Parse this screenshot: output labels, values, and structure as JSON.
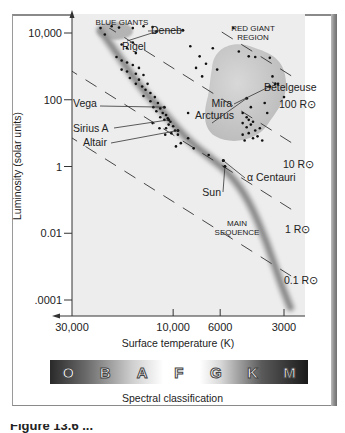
{
  "chart_data": {
    "type": "scatter",
    "xlabel": "Surface temperature (K)",
    "ylabel": "Luminosity (solar units)",
    "x_scale": "log",
    "y_scale": "log",
    "x_reversed": true,
    "xlim": [
      35000,
      2500
    ],
    "ylim": [
      3e-05,
      50000
    ],
    "x_ticks": [
      30000,
      10000,
      6000,
      3000
    ],
    "x_tick_labels": [
      "30,000",
      "10,000",
      "6000",
      "3000"
    ],
    "y_ticks": [
      10000,
      100,
      1,
      0.01,
      0.0001
    ],
    "y_tick_labels": [
      "10,000",
      "100",
      "1",
      "0.01",
      ".0001"
    ],
    "grid": false,
    "regions": [
      {
        "name": "BLUE GIANTS",
        "label_lines": [
          "BLUE GIANTS"
        ]
      },
      {
        "name": "RED GIANT REGION",
        "label_lines": [
          "RED GIANT",
          "REGION"
        ]
      },
      {
        "name": "MAIN SEQUENCE",
        "label_lines": [
          "MAIN",
          "SEQUENCE"
        ]
      }
    ],
    "main_sequence_band": [
      {
        "T": 22000,
        "L": 12000
      },
      {
        "T": 18000,
        "L": 2000
      },
      {
        "T": 14000,
        "L": 200
      },
      {
        "T": 11000,
        "L": 40
      },
      {
        "T": 8500,
        "L": 6
      },
      {
        "T": 6500,
        "L": 1.6
      },
      {
        "T": 5400,
        "L": 0.6
      },
      {
        "T": 4400,
        "L": 0.1
      },
      {
        "T": 3600,
        "L": 0.005
      },
      {
        "T": 3100,
        "L": 0.0003
      },
      {
        "T": 2800,
        "L": 6e-05
      }
    ],
    "radius_lines": [
      {
        "label": "100 R⊙",
        "R": 100
      },
      {
        "label": "10 R⊙",
        "R": 10
      },
      {
        "label": "1 R⊙",
        "R": 1
      },
      {
        "label": "0.1 R⊙",
        "R": 0.1
      }
    ],
    "named_stars": [
      {
        "name": "Deneb",
        "T": 9000,
        "L": 12000
      },
      {
        "name": "Rigel",
        "T": 12000,
        "L": 11000
      },
      {
        "name": "Betelgeuse",
        "T": 3300,
        "L": 300
      },
      {
        "name": "Mira",
        "T": 3500,
        "L": 250
      },
      {
        "name": "Arcturus",
        "T": 4500,
        "L": 110
      },
      {
        "name": "Vega",
        "T": 11000,
        "L": 60
      },
      {
        "name": "Sirius A",
        "T": 10500,
        "L": 25
      },
      {
        "name": "Altair",
        "T": 9500,
        "L": 12
      },
      {
        "name": "α Centauri",
        "T": 5800,
        "L": 1.5
      },
      {
        "name": "Sun",
        "T": 5700,
        "L": 1
      }
    ],
    "stars": [
      [
        22000,
        14000
      ],
      [
        19500,
        16000
      ],
      [
        18000,
        14500
      ],
      [
        15500,
        14000
      ],
      [
        13800,
        16000
      ],
      [
        12500,
        15000
      ],
      [
        21000,
        9000
      ],
      [
        17500,
        4500
      ],
      [
        16500,
        3500
      ],
      [
        15500,
        5200
      ],
      [
        15000,
        2500
      ],
      [
        18500,
        1900
      ],
      [
        17500,
        1500
      ],
      [
        16500,
        1300
      ],
      [
        15500,
        1100
      ],
      [
        17500,
        800
      ],
      [
        16500,
        700
      ],
      [
        15000,
        600
      ],
      [
        14500,
        900
      ],
      [
        16000,
        450
      ],
      [
        14500,
        400
      ],
      [
        13800,
        550
      ],
      [
        15000,
        300
      ],
      [
        14000,
        250
      ],
      [
        13200,
        300
      ],
      [
        13500,
        200
      ],
      [
        12800,
        160
      ],
      [
        13800,
        130
      ],
      [
        12200,
        120
      ],
      [
        12800,
        90
      ],
      [
        11800,
        80
      ],
      [
        12400,
        60
      ],
      [
        11500,
        55
      ],
      [
        12000,
        45
      ],
      [
        11200,
        40
      ],
      [
        10800,
        35
      ],
      [
        11500,
        30
      ],
      [
        10600,
        28
      ],
      [
        11000,
        25
      ],
      [
        10300,
        22
      ],
      [
        10500,
        18
      ],
      [
        10000,
        16
      ],
      [
        10800,
        14
      ],
      [
        9800,
        12
      ],
      [
        10200,
        10
      ],
      [
        9500,
        9
      ],
      [
        11600,
        14
      ],
      [
        10900,
        9
      ],
      [
        12500,
        20
      ],
      [
        8500,
        7
      ],
      [
        9200,
        5
      ],
      [
        8000,
        3.5
      ],
      [
        6800,
        2.2
      ],
      [
        5800,
        1.5
      ],
      [
        5700,
        1
      ],
      [
        9700,
        4
      ],
      [
        8500,
        40
      ],
      [
        7500,
        2000
      ],
      [
        7800,
        900
      ],
      [
        7000,
        1200
      ],
      [
        7300,
        500
      ],
      [
        6200,
        800
      ],
      [
        6500,
        3500
      ],
      [
        5200,
        14000
      ],
      [
        8300,
        4000
      ],
      [
        4900,
        2800
      ],
      [
        4400,
        2000
      ],
      [
        4100,
        1900
      ],
      [
        3500,
        1800
      ],
      [
        3400,
        500
      ],
      [
        3200,
        300
      ],
      [
        3000,
        120
      ],
      [
        3700,
        80
      ],
      [
        3600,
        40
      ],
      [
        4300,
        60
      ],
      [
        4700,
        40
      ],
      [
        4500,
        30
      ],
      [
        4400,
        25
      ],
      [
        4700,
        20
      ],
      [
        4500,
        15
      ],
      [
        4300,
        18
      ],
      [
        4200,
        22
      ],
      [
        4100,
        12
      ],
      [
        4400,
        10
      ],
      [
        4700,
        9
      ],
      [
        4000,
        8
      ],
      [
        3900,
        14
      ],
      [
        4200,
        7
      ],
      [
        4600,
        6
      ],
      [
        3800,
        6
      ]
    ]
  },
  "spectral_classification": {
    "title": "Spectral classification",
    "classes": [
      "O",
      "B",
      "A",
      "F",
      "G",
      "K",
      "M"
    ]
  },
  "caption_partial": "Figure 13.6 ..."
}
